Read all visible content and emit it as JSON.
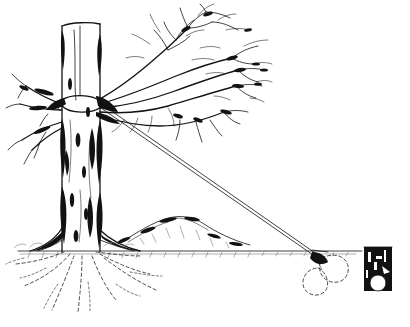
{
  "image": {
    "kind": "line-art-illustration",
    "subject": "Tree guyed with a rope to a buried deadman anchor",
    "style": "black ink pen-and-ink hatching on white",
    "width": 410,
    "height": 327,
    "background_color": "#ffffff",
    "ink_color": "#121212"
  },
  "scene": {
    "ground_line_y": 250,
    "ground_line_x_start": 18,
    "ground_line_x_end": 362,
    "horizon_note": "single ruled ground line with short hatch tufts"
  },
  "tree": {
    "name": "guyed-tree",
    "trunk": {
      "top_y": 24,
      "base_y": 252,
      "left_x": 62,
      "right_x": 100,
      "bark_shading": "heavy black vertical patches along both trunk edges",
      "topped": true
    },
    "canopy": {
      "description": "bare deciduous branches fanning up and to the right",
      "extent_x": [
        12,
        272
      ],
      "extent_y": [
        8,
        130
      ],
      "leafless": true
    },
    "roots": {
      "description": "dashed underground root system radiating below the base",
      "style": "dashed",
      "extent_x": [
        8,
        150
      ],
      "extent_y": [
        252,
        312
      ]
    }
  },
  "guy_rope": {
    "name": "guy-rope",
    "description": "double-line rope from trunk collar down to the anchor",
    "attach_point": [
      100,
      103
    ],
    "anchor_point": [
      318,
      256
    ],
    "line_count": 2,
    "collar": "rope loop wrapped around trunk at attachment height"
  },
  "anchor": {
    "name": "deadman-anchor",
    "description": "buried anchor shown in dashed outline beneath the ground",
    "position": [
      322,
      262
    ],
    "buried": true,
    "outline_style": "dashed"
  },
  "post": {
    "name": "log-post",
    "description": "dark cut log / post end at the right edge",
    "x": 364,
    "y": 247,
    "width": 28,
    "height": 44
  },
  "mound": {
    "name": "earth-mound",
    "description": "low hatched mound of soil in the mid-ground",
    "extent_x": [
      120,
      250
    ],
    "peak_y": 218
  },
  "labels": {
    "caption": ""
  }
}
